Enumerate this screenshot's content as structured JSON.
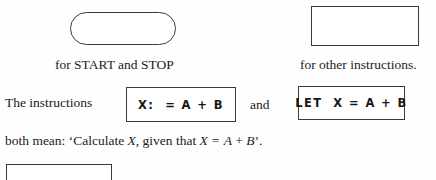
{
  "page": {
    "background": "#fefefe",
    "ink": "#1a1a1a"
  },
  "symbols": {
    "start_stop": {
      "shape_name": "rounded-rectangle-stadium",
      "caption": "for START and STOP",
      "stroke": "#3b3b3b"
    },
    "other_instructions": {
      "shape_name": "rectangle",
      "caption": "for other instructions.",
      "stroke": "#3a3a3a"
    },
    "partial_bottom": {
      "shape_name": "rectangle-cut-off",
      "stroke": "#3a3a3a"
    }
  },
  "body": {
    "lead_in": "The instructions",
    "conjunction": "and",
    "instruction_box_1": "X:  = A + B",
    "instruction_box_2": "LET  X = A + B",
    "meaning": {
      "prefix": "both mean: ‘Calculate ",
      "var_1": "X",
      "middle": ", given that ",
      "var_2": "X",
      "equals": " = ",
      "var_3": "A",
      "plus": " + ",
      "var_4": "B",
      "suffix": "’."
    }
  }
}
